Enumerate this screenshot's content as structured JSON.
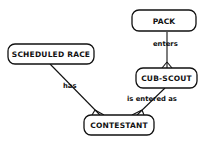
{
  "diagram": {
    "type": "entity-relationship",
    "entities": [
      {
        "id": "pack",
        "label": "PACK"
      },
      {
        "id": "cub_scout",
        "label": "CUB-SCOUT"
      },
      {
        "id": "scheduled_race",
        "label": "SCHEDULED RACE"
      },
      {
        "id": "contestant",
        "label": "CONTESTANT"
      }
    ],
    "relationships": [
      {
        "from": "pack",
        "to": "cub_scout",
        "label": "enters",
        "many_end": "cub_scout"
      },
      {
        "from": "scheduled_race",
        "to": "contestant",
        "label": "has",
        "many_end": "contestant"
      },
      {
        "from": "cub_scout",
        "to": "contestant",
        "label": "is entered as",
        "many_end": "contestant"
      }
    ],
    "colors": {
      "stroke": "#111111",
      "background": "#ffffff"
    }
  }
}
